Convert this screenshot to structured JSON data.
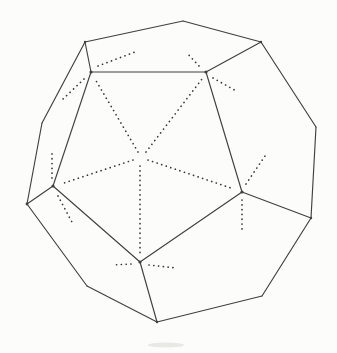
{
  "figure": {
    "name": "dodecahedron-line-drawing",
    "canvas": {
      "width": 337,
      "height": 353
    },
    "background_color": "#fcfcfa",
    "solid_stroke_color": "#404040",
    "solid_stroke_width": 1.15,
    "dot_color": "#383838",
    "dot_stroke_width": 1.7,
    "dot_dasharray": "0.1 4.7",
    "vertices": {
      "top": [
        183,
        21
      ],
      "top_right": [
        261,
        42
      ],
      "right_upper": [
        316,
        127
      ],
      "right_lower": [
        311,
        218
      ],
      "bottom_right": [
        262,
        296
      ],
      "bottom": [
        157,
        322
      ],
      "bottom_left": [
        87,
        286
      ],
      "left_lower": [
        27,
        204
      ],
      "left_upper": [
        42,
        123
      ],
      "top_left": [
        85,
        42
      ],
      "front_top_left": [
        91,
        72
      ],
      "front_top_right": [
        206,
        72
      ],
      "front_right": [
        242,
        192
      ],
      "front_bottom": [
        140,
        262
      ],
      "front_left": [
        53,
        186
      ],
      "front_center": [
        141,
        158
      ]
    },
    "solid_edges": [
      {
        "name": "silhouette-top-to-top-right",
        "from": "top",
        "to": "top_right"
      },
      {
        "name": "silhouette-top-right-to-right-upper",
        "from": "top_right",
        "to": "right_upper"
      },
      {
        "name": "silhouette-right-upper-to-right-lower",
        "from": "right_upper",
        "to": "right_lower"
      },
      {
        "name": "silhouette-right-lower-to-bottom-right",
        "from": "right_lower",
        "to": "bottom_right"
      },
      {
        "name": "silhouette-bottom-right-to-bottom",
        "from": "bottom_right",
        "to": "bottom"
      },
      {
        "name": "silhouette-bottom-to-bottom-left",
        "from": "bottom",
        "to": "bottom_left"
      },
      {
        "name": "silhouette-bottom-left-to-left-lower",
        "from": "bottom_left",
        "to": "left_lower"
      },
      {
        "name": "silhouette-left-lower-to-left-upper",
        "from": "left_lower",
        "to": "left_upper"
      },
      {
        "name": "silhouette-left-upper-to-top-left",
        "from": "left_upper",
        "to": "top_left"
      },
      {
        "name": "silhouette-top-left-to-top",
        "from": "top_left",
        "to": "top"
      },
      {
        "name": "front-face-top-edge",
        "from": "front_top_left",
        "to": "front_top_right"
      },
      {
        "name": "front-face-right-edge",
        "from": "front_top_right",
        "to": "front_right"
      },
      {
        "name": "front-face-bottom-right-edge",
        "from": "front_right",
        "to": "front_bottom"
      },
      {
        "name": "front-face-bottom-left-edge",
        "from": "front_bottom",
        "to": "front_left"
      },
      {
        "name": "front-face-left-edge",
        "from": "front_left",
        "to": "front_top_left"
      },
      {
        "name": "spoke-front-top-left-to-top-left",
        "from": "front_top_left",
        "to": "top_left"
      },
      {
        "name": "spoke-front-top-right-to-top-right",
        "from": "front_top_right",
        "to": "top_right"
      },
      {
        "name": "spoke-front-right-to-right-lower",
        "from": "front_right",
        "to": "right_lower"
      },
      {
        "name": "spoke-front-bottom-to-bottom",
        "from": "front_bottom",
        "to": "bottom"
      },
      {
        "name": "spoke-front-left-to-left-lower",
        "from": "front_left",
        "to": "left_lower"
      }
    ],
    "dotted_lines": [
      {
        "name": "dotted-center-to-front-top-left",
        "from": [
          138,
          152
        ],
        "to": [
          95,
          79
        ]
      },
      {
        "name": "dotted-center-to-front-top-right",
        "from": [
          146,
          152
        ],
        "to": [
          202,
          79
        ]
      },
      {
        "name": "dotted-center-to-front-right",
        "from": [
          148,
          160
        ],
        "to": [
          234,
          189
        ]
      },
      {
        "name": "dotted-center-to-front-bottom",
        "from": [
          140,
          166
        ],
        "to": [
          140,
          254
        ]
      },
      {
        "name": "dotted-center-to-front-left",
        "from": [
          133,
          160
        ],
        "to": [
          61,
          184
        ]
      },
      {
        "name": "dotted-ray-front-top-left-into-top-face",
        "from": [
          98,
          66
        ],
        "to": [
          135,
          52
        ]
      },
      {
        "name": "dotted-ray-front-top-left-into-upper-left-face",
        "from": [
          84,
          79
        ],
        "to": [
          62,
          100
        ]
      },
      {
        "name": "dotted-ray-front-top-right-into-top-face",
        "from": [
          199,
          66
        ],
        "to": [
          186,
          52
        ]
      },
      {
        "name": "dotted-ray-front-top-right-into-right-face",
        "from": [
          213,
          78
        ],
        "to": [
          238,
          92
        ]
      },
      {
        "name": "dotted-ray-front-right-into-right-face",
        "from": [
          246,
          184
        ],
        "to": [
          265,
          156
        ]
      },
      {
        "name": "dotted-ray-front-right-into-lower-right-face",
        "from": [
          242,
          200
        ],
        "to": [
          242,
          233
        ]
      },
      {
        "name": "dotted-ray-front-bottom-into-lower-left-face",
        "from": [
          131,
          264
        ],
        "to": [
          112,
          265
        ]
      },
      {
        "name": "dotted-ray-front-bottom-into-lower-right-face",
        "from": [
          149,
          265
        ],
        "to": [
          177,
          268
        ]
      },
      {
        "name": "dotted-ray-front-left-into-upper-left-face",
        "from": [
          52,
          178
        ],
        "to": [
          52,
          152
        ]
      },
      {
        "name": "dotted-ray-front-left-into-lower-left-face",
        "from": [
          58,
          196
        ],
        "to": [
          73,
          224
        ]
      }
    ],
    "vertex_dots": [
      {
        "name": "vertex-dot-front-top-left",
        "at": "front_top_left",
        "r": 1.6
      },
      {
        "name": "vertex-dot-front-top-right",
        "at": "front_top_right",
        "r": 1.6
      },
      {
        "name": "vertex-dot-front-right",
        "at": "front_right",
        "r": 1.6
      },
      {
        "name": "vertex-dot-front-bottom",
        "at": "front_bottom",
        "r": 1.6
      },
      {
        "name": "vertex-dot-front-left",
        "at": "front_left",
        "r": 1.6
      },
      {
        "name": "vertex-dot-left-lower",
        "at": "left_lower",
        "r": 1.4
      },
      {
        "name": "vertex-dot-top-left",
        "at": "top_left",
        "r": 1.2
      },
      {
        "name": "vertex-dot-top-right",
        "at": "top_right",
        "r": 1.2
      },
      {
        "name": "vertex-dot-right-lower",
        "at": "right_lower",
        "r": 1.2
      },
      {
        "name": "vertex-dot-bottom",
        "at": "bottom",
        "r": 1.2
      }
    ],
    "smudge": {
      "cx": 166,
      "cy": 345,
      "rx": 18,
      "ry": 2.5,
      "color": "#b9b9b2",
      "opacity": 0.3
    }
  }
}
